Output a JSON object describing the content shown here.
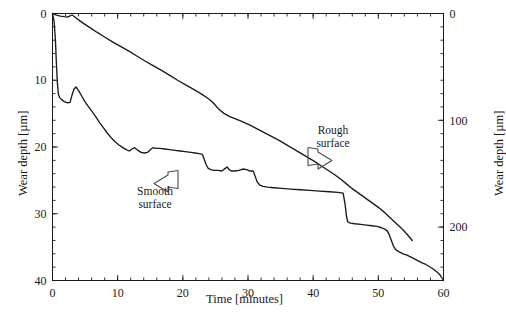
{
  "chart_data": {
    "type": "line",
    "title": "",
    "xlabel": "Time [minutes]",
    "ylabel": "Wear depth [µm]",
    "ylabel_right": "Wear depth [µm]",
    "xlim": [
      0,
      60
    ],
    "ylim_left": [
      0,
      40
    ],
    "ylim_right": [
      0,
      250
    ],
    "y_inverted": true,
    "grid": false,
    "legend": "none",
    "xticks": [
      0,
      10,
      20,
      30,
      40,
      50,
      60
    ],
    "xticklabels": [
      "0",
      "10",
      "20",
      "30",
      "40",
      "50",
      "60"
    ],
    "yticks_left": [
      0,
      10,
      20,
      30,
      40
    ],
    "yticklabels_left": [
      "0",
      "10",
      "20",
      "30",
      "40"
    ],
    "yticks_right": [
      0,
      100,
      200
    ],
    "yticklabels_right": [
      "0",
      "100",
      "200"
    ],
    "minor_tick_interval_x": 2,
    "minor_tick_interval_y_left": 2,
    "minor_tick_interval_y_right": 12.5,
    "line_color": "#1a1a1a",
    "annotation_color": "#4a4a4a",
    "series": [
      {
        "name": "Smooth surface",
        "axis": "left",
        "units": "µm",
        "points": [
          [
            0.0,
            0.0
          ],
          [
            0.25,
            1.2
          ],
          [
            0.45,
            4.0
          ],
          [
            0.6,
            7.5
          ],
          [
            0.75,
            10.4
          ],
          [
            0.9,
            12.1
          ],
          [
            1.1,
            12.6
          ],
          [
            1.4,
            12.9
          ],
          [
            1.8,
            13.2
          ],
          [
            2.3,
            13.4
          ],
          [
            2.7,
            13.3
          ],
          [
            3.0,
            12.2
          ],
          [
            3.3,
            11.3
          ],
          [
            3.6,
            11.0
          ],
          [
            3.9,
            11.4
          ],
          [
            4.2,
            11.9
          ],
          [
            4.5,
            12.4
          ],
          [
            4.9,
            13.1
          ],
          [
            5.4,
            13.8
          ],
          [
            6.0,
            14.6
          ],
          [
            6.6,
            15.4
          ],
          [
            7.2,
            16.3
          ],
          [
            7.8,
            17.1
          ],
          [
            8.4,
            17.9
          ],
          [
            9.0,
            18.6
          ],
          [
            9.6,
            19.2
          ],
          [
            10.2,
            19.7
          ],
          [
            10.8,
            20.1
          ],
          [
            11.3,
            20.4
          ],
          [
            11.8,
            20.6
          ],
          [
            12.2,
            20.3
          ],
          [
            12.6,
            20.1
          ],
          [
            13.1,
            20.5
          ],
          [
            13.6,
            20.8
          ],
          [
            14.1,
            20.9
          ],
          [
            14.6,
            20.8
          ],
          [
            15.0,
            20.4
          ],
          [
            15.4,
            20.1
          ],
          [
            15.9,
            20.2
          ],
          [
            16.5,
            20.2
          ],
          [
            17.2,
            20.3
          ],
          [
            18.0,
            20.4
          ],
          [
            18.8,
            20.5
          ],
          [
            19.6,
            20.6
          ],
          [
            20.4,
            20.7
          ],
          [
            21.2,
            20.8
          ],
          [
            21.9,
            20.9
          ],
          [
            22.5,
            21.0
          ],
          [
            23.0,
            21.1
          ],
          [
            23.3,
            21.9
          ],
          [
            23.6,
            22.7
          ],
          [
            23.9,
            23.2
          ],
          [
            24.3,
            23.4
          ],
          [
            24.8,
            23.5
          ],
          [
            25.4,
            23.5
          ],
          [
            26.0,
            23.6
          ],
          [
            26.5,
            23.2
          ],
          [
            26.8,
            23.0
          ],
          [
            27.1,
            23.4
          ],
          [
            27.5,
            23.6
          ],
          [
            28.0,
            23.6
          ],
          [
            28.6,
            23.5
          ],
          [
            29.2,
            23.3
          ],
          [
            29.8,
            23.4
          ],
          [
            30.3,
            23.6
          ],
          [
            30.8,
            23.6
          ],
          [
            31.1,
            24.4
          ],
          [
            31.4,
            25.2
          ],
          [
            31.8,
            25.7
          ],
          [
            32.3,
            25.9
          ],
          [
            33.0,
            26.0
          ],
          [
            34.0,
            26.1
          ],
          [
            35.2,
            26.2
          ],
          [
            36.5,
            26.3
          ],
          [
            38.0,
            26.4
          ],
          [
            39.5,
            26.5
          ],
          [
            41.0,
            26.6
          ],
          [
            42.5,
            26.7
          ],
          [
            43.8,
            26.8
          ],
          [
            44.6,
            26.9
          ],
          [
            44.9,
            28.6
          ],
          [
            45.1,
            30.3
          ],
          [
            45.3,
            31.2
          ],
          [
            45.7,
            31.4
          ],
          [
            46.4,
            31.5
          ],
          [
            47.3,
            31.6
          ],
          [
            48.2,
            31.7
          ],
          [
            49.0,
            31.8
          ],
          [
            49.8,
            31.9
          ],
          [
            50.5,
            32.1
          ],
          [
            51.0,
            32.3
          ],
          [
            51.4,
            32.6
          ],
          [
            51.7,
            33.2
          ],
          [
            52.0,
            34.0
          ],
          [
            52.3,
            34.8
          ],
          [
            52.7,
            35.4
          ],
          [
            53.2,
            35.7
          ],
          [
            53.8,
            36.0
          ],
          [
            54.4,
            36.2
          ],
          [
            55.0,
            36.5
          ],
          [
            55.6,
            36.8
          ],
          [
            56.2,
            37.1
          ],
          [
            56.8,
            37.4
          ],
          [
            57.3,
            37.6
          ],
          [
            57.8,
            37.9
          ],
          [
            58.3,
            38.2
          ],
          [
            58.7,
            38.5
          ],
          [
            59.1,
            38.8
          ],
          [
            59.5,
            39.2
          ],
          [
            59.8,
            39.7
          ],
          [
            60.0,
            40.0
          ]
        ]
      },
      {
        "name": "Rough surface",
        "axis": "right",
        "units": "µm",
        "points": [
          [
            0.0,
            0.0
          ],
          [
            0.6,
            1.5
          ],
          [
            1.2,
            2.4
          ],
          [
            1.8,
            3.0
          ],
          [
            2.3,
            3.4
          ],
          [
            2.7,
            2.2
          ],
          [
            3.0,
            1.4
          ],
          [
            3.4,
            3.1
          ],
          [
            4.0,
            6.0
          ],
          [
            4.8,
            9.5
          ],
          [
            5.8,
            13.5
          ],
          [
            6.8,
            17.5
          ],
          [
            8.0,
            22.0
          ],
          [
            9.2,
            26.5
          ],
          [
            10.5,
            31.0
          ],
          [
            11.8,
            35.5
          ],
          [
            13.0,
            40.0
          ],
          [
            14.2,
            44.5
          ],
          [
            15.5,
            49.0
          ],
          [
            16.8,
            53.5
          ],
          [
            18.0,
            58.0
          ],
          [
            19.2,
            62.5
          ],
          [
            20.5,
            67.0
          ],
          [
            21.8,
            71.5
          ],
          [
            23.0,
            76.0
          ],
          [
            24.0,
            80.0
          ],
          [
            24.8,
            84.5
          ],
          [
            25.5,
            89.5
          ],
          [
            26.3,
            93.5
          ],
          [
            27.2,
            96.5
          ],
          [
            28.2,
            99.0
          ],
          [
            29.2,
            101.5
          ],
          [
            30.3,
            104.5
          ],
          [
            31.4,
            108.0
          ],
          [
            32.5,
            111.5
          ],
          [
            33.6,
            115.0
          ],
          [
            34.7,
            118.5
          ],
          [
            35.8,
            122.5
          ],
          [
            36.9,
            126.5
          ],
          [
            38.0,
            130.5
          ],
          [
            39.1,
            134.5
          ],
          [
            40.2,
            138.5
          ],
          [
            41.2,
            142.5
          ],
          [
            42.2,
            146.5
          ],
          [
            43.2,
            150.5
          ],
          [
            44.2,
            155.0
          ],
          [
            45.2,
            160.0
          ],
          [
            46.0,
            164.0
          ],
          [
            46.8,
            167.5
          ],
          [
            47.6,
            171.0
          ],
          [
            48.4,
            174.5
          ],
          [
            49.2,
            178.0
          ],
          [
            50.0,
            181.5
          ],
          [
            50.8,
            185.5
          ],
          [
            51.6,
            190.0
          ],
          [
            52.3,
            194.0
          ],
          [
            53.0,
            198.0
          ],
          [
            53.7,
            202.0
          ],
          [
            54.3,
            206.0
          ],
          [
            54.8,
            209.5
          ],
          [
            55.2,
            212.5
          ]
        ]
      }
    ],
    "annotations": [
      {
        "text": "Smooth surface",
        "lines": [
          "Smooth",
          "surface"
        ],
        "arrow": "left",
        "points_to": "smooth-surface-curve"
      },
      {
        "text": "Rough surface",
        "lines": [
          "Rough",
          "surface"
        ],
        "arrow": "right",
        "points_to": "rough-surface-curve"
      }
    ]
  }
}
